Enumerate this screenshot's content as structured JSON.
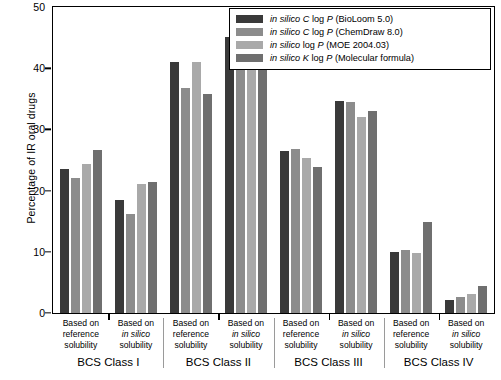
{
  "chart_data": {
    "type": "bar",
    "title": "",
    "xlabel": "",
    "ylabel": "Percentage of IR oral drugs",
    "ylim": [
      0,
      50
    ],
    "yticks": [
      0,
      10,
      20,
      30,
      40,
      50
    ],
    "grid": false,
    "legend_position": "top-right",
    "legend": [
      "in silico C log P (BioLoom 5.0)",
      "in silico C log P (ChemDraw 8.0)",
      "in silico log P (MOE 2004.03)",
      "in silico K log P (Molecular formula)"
    ],
    "groups": [
      "BCS Class I",
      "BCS Class II",
      "BCS Class III",
      "BCS Class IV"
    ],
    "subgroups": [
      "Based on reference solubility",
      "Based on in silico solubility"
    ],
    "categories": [
      "BCS Class I / reference solubility",
      "BCS Class I / in silico solubility",
      "BCS Class II / reference solubility",
      "BCS Class II / in silico solubility",
      "BCS Class III / reference solubility",
      "BCS Class III / in silico solubility",
      "BCS Class IV / reference solubility",
      "BCS Class IV / in silico solubility"
    ],
    "series": [
      {
        "name": "in silico C log P (BioLoom 5.0)",
        "color": "#3a3a3a",
        "values": [
          23.5,
          18.5,
          41.0,
          45.2,
          26.5,
          34.6,
          10.0,
          2.0
        ]
      },
      {
        "name": "in silico C log P (ChemDraw 8.0)",
        "color": "#8c8c8c",
        "values": [
          22.0,
          16.2,
          36.8,
          42.5,
          26.8,
          34.5,
          10.2,
          2.5
        ]
      },
      {
        "name": "in silico log P (MOE 2004.03)",
        "color": "#a9a9a9",
        "values": [
          24.3,
          21.0,
          41.0,
          43.8,
          25.4,
          32.1,
          9.8,
          3.0
        ]
      },
      {
        "name": "in silico K log P (Molecular formula)",
        "color": "#6f6f6f",
        "values": [
          26.6,
          21.4,
          35.8,
          41.0,
          23.8,
          33.0,
          14.8,
          4.3
        ]
      }
    ]
  },
  "sublabel_lines": {
    "reference": [
      "Based on",
      "reference",
      "solubility"
    ],
    "insilico": [
      "Based on",
      "in silico",
      "solubility"
    ]
  },
  "legend_text": {
    "prefix": "in silico",
    "rows": [
      {
        "em": "in silico",
        "rest": " C log P (BioLoom 5.0)"
      },
      {
        "em": "in silico",
        "rest": " C log P (ChemDraw 8.0)"
      },
      {
        "em": "in silico",
        "rest": " log P (MOE 2004.03)"
      },
      {
        "em": "in silico",
        "rest": " K log P (Molecular formula)"
      }
    ]
  }
}
